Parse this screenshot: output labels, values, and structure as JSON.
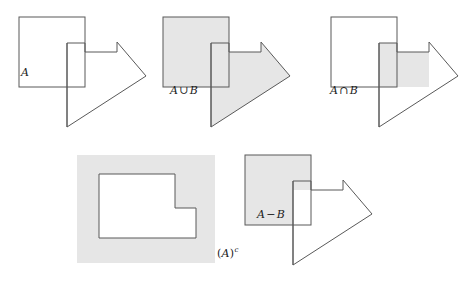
{
  "figure": {
    "width": 461,
    "height": 283,
    "background": "#ffffff",
    "stroke_color": "#595959",
    "stroke_width": 1,
    "shade_color": "#e6e6e6",
    "white": "#ffffff",
    "label_color": "#1b1b1b"
  },
  "geometry": {
    "square_a": {
      "x": 19,
      "y": 17,
      "width": 66,
      "height": 70
    },
    "polygon_b_points": "67,43 85,43 85,52 117,52 117,42 146,76 67,127",
    "polygon_b_notch_outline": "67,43 85,43 85,52 117,52 117,42 146,76 67,127 67,43",
    "intersection_points": "67,52 85,52 85,43 67,43 67,87 117,87 117,52 85,52",
    "shade_rect_complement": {
      "x": 77,
      "y": 155,
      "width": 138,
      "height": 108
    },
    "lshape_hole": "99,174 175,174 175,208 196,208 196,238 99,238"
  },
  "panels": [
    {
      "id": "panel-a-b",
      "name": "sets-a-and-b",
      "label": {
        "text": "A",
        "parts": [
          "A"
        ],
        "x": 23,
        "y": 68
      },
      "shading": "none",
      "description": "Square A and arrow-shaped set B, both unshaded outlines"
    },
    {
      "id": "panel-union",
      "name": "a-union-b",
      "label": {
        "text": "A ∪ B",
        "left": "A",
        "op": "∪",
        "right": "B",
        "x": 170,
        "y": 86
      },
      "shading": "union",
      "description": "Both square A and polygon B shaded gray"
    },
    {
      "id": "panel-intersection",
      "name": "a-intersect-b",
      "label": {
        "text": "A ∩ B",
        "left": "A",
        "op": "∩",
        "right": "B",
        "x": 330,
        "y": 86
      },
      "shading": "intersection",
      "description": "Only the overlapping region of A and B shaded gray"
    },
    {
      "id": "panel-complement",
      "name": "a-complement",
      "label": {
        "text": "(A)c",
        "open": "(",
        "base": "A",
        "close": ")",
        "sup": "c",
        "x": 217,
        "y": 249
      },
      "shading": "complement",
      "description": "Gray universe rectangle with white L-shaped hole representing complement of A"
    },
    {
      "id": "panel-difference",
      "name": "a-minus-b",
      "label": {
        "text": "A − B",
        "left": "A",
        "op": "−",
        "right": "B",
        "x": 257,
        "y": 214
      },
      "shading": "difference",
      "description": "Square A shaded gray except the part overlapping polygon B"
    }
  ]
}
